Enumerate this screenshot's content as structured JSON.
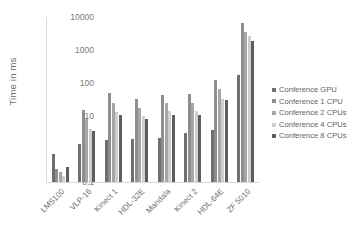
{
  "chart_data": {
    "type": "bar",
    "title": "",
    "xlabel": "",
    "ylabel": "Time in ms",
    "yscale": "log",
    "ylim": [
      0.1,
      10000
    ],
    "ytick_labels": [
      "10000",
      "1000",
      "100",
      "10",
      "1",
      "0,1"
    ],
    "ytick_values": [
      10000,
      1000,
      100,
      10,
      1,
      0.1
    ],
    "grid": false,
    "legend_position": "right",
    "categories": [
      "LMS100",
      "VLP-16",
      "Kinect 1",
      "HDL-32E",
      "Mandala",
      "Kinect 2",
      "HDL-64E",
      "ZF 5010"
    ],
    "series": [
      {
        "name": "Conference GPU",
        "color": "#6f6f6f",
        "values": [
          0.7,
          1.4,
          1.9,
          2.0,
          2.1,
          3.0,
          3.8,
          175
        ]
      },
      {
        "name": "Conference 1 CPU",
        "color": "#8e8e8e",
        "values": [
          0.25,
          15,
          50,
          32,
          43,
          48,
          120,
          6500
        ]
      },
      {
        "name": "Conference 2 CPUs",
        "color": "#a6a6a6",
        "values": [
          0.2,
          8,
          25,
          18,
          24,
          25,
          65,
          3600
        ]
      },
      {
        "name": "Conference 4 CPUs",
        "color": "#cfcfcf",
        "values": [
          0.15,
          4,
          13,
          10,
          14,
          14,
          33,
          2700
        ]
      },
      {
        "name": "Conference 8 CPUs",
        "color": "#5e5e5e",
        "values": [
          0.28,
          3.6,
          11,
          8,
          11,
          11,
          30,
          1900
        ]
      }
    ]
  }
}
